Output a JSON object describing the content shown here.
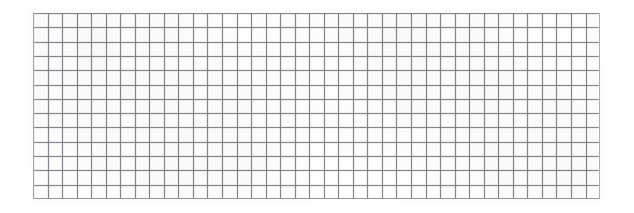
{
  "image": {
    "kind": "grid-pattern",
    "description": "Scanned rectangular grid / graph-paper mesh",
    "background_color": "#ffffff",
    "line_color": "#96969c",
    "line_width_px": 1,
    "canvas": {
      "width_px": 634,
      "height_px": 213
    },
    "grid": {
      "left_px": 33,
      "top_px": 13,
      "width_px": 567,
      "height_px": 186,
      "columns": 39,
      "rows": 13,
      "cell_width_px": 14.54,
      "cell_height_px": 14.31,
      "has_outer_border": true,
      "line_style": "solid"
    },
    "texture": {
      "type": "scan-mottle",
      "edge_feathering": true
    }
  }
}
